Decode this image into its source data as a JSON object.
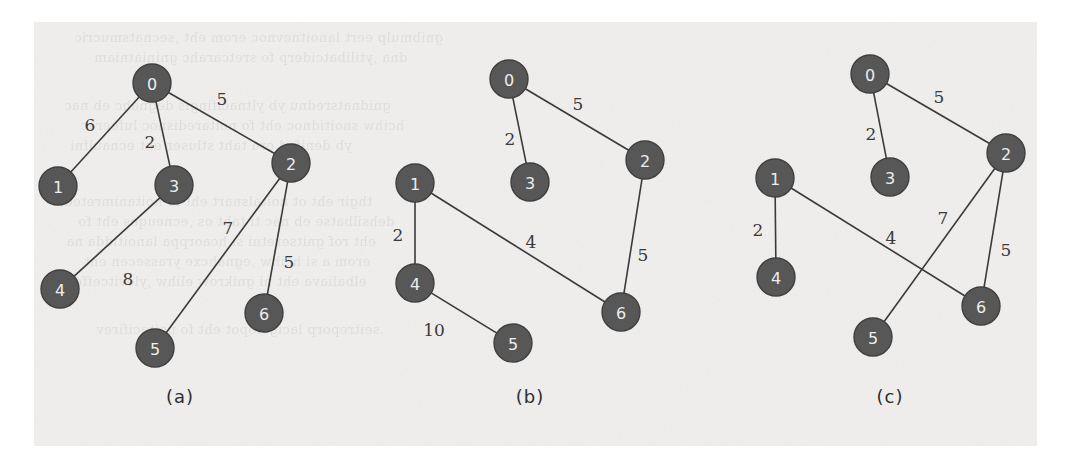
{
  "figure": {
    "background_color": "#f0efee",
    "page_color": "#ffffff",
    "node_fill": "#575757",
    "node_text_color": "#ededed",
    "edge_color": "#3a3a3a"
  },
  "chart_data": {
    "type": "diagram",
    "diagram_kind": "weighted-undirected-graph",
    "title": "",
    "panels": [
      {
        "caption": "(a)",
        "caption_x": 180,
        "caption_y": 396,
        "nodes": [
          {
            "id": "0",
            "x": 152,
            "y": 83,
            "r": 19
          },
          {
            "id": "1",
            "x": 58,
            "y": 186,
            "r": 19
          },
          {
            "id": "3",
            "x": 174,
            "y": 185,
            "r": 19
          },
          {
            "id": "2",
            "x": 291,
            "y": 163,
            "r": 19
          },
          {
            "id": "4",
            "x": 60,
            "y": 289,
            "r": 19
          },
          {
            "id": "5",
            "x": 155,
            "y": 348,
            "r": 19
          },
          {
            "id": "6",
            "x": 264,
            "y": 313,
            "r": 19
          }
        ],
        "edges": [
          {
            "from": "0",
            "to": "1",
            "weight": "6",
            "label_x": 90,
            "label_y": 125
          },
          {
            "from": "0",
            "to": "3",
            "weight": "2",
            "label_x": 150,
            "label_y": 142
          },
          {
            "from": "0",
            "to": "2",
            "weight": "5",
            "label_x": 222,
            "label_y": 99
          },
          {
            "from": "3",
            "to": "4",
            "weight": "8",
            "label_x": 128,
            "label_y": 279
          },
          {
            "from": "2",
            "to": "5",
            "weight": "7",
            "label_x": 228,
            "label_y": 228
          },
          {
            "from": "2",
            "to": "6",
            "weight": "5",
            "label_x": 289,
            "label_y": 262
          }
        ]
      },
      {
        "caption": "(b)",
        "caption_x": 530,
        "caption_y": 396,
        "nodes": [
          {
            "id": "0",
            "x": 509,
            "y": 79,
            "r": 19
          },
          {
            "id": "3",
            "x": 530,
            "y": 182,
            "r": 19
          },
          {
            "id": "2",
            "x": 645,
            "y": 160,
            "r": 19
          },
          {
            "id": "1",
            "x": 415,
            "y": 183,
            "r": 19
          },
          {
            "id": "4",
            "x": 415,
            "y": 283,
            "r": 19
          },
          {
            "id": "5",
            "x": 513,
            "y": 343,
            "r": 19
          },
          {
            "id": "6",
            "x": 621,
            "y": 312,
            "r": 19
          }
        ],
        "edges": [
          {
            "from": "0",
            "to": "3",
            "weight": "2",
            "label_x": 510,
            "label_y": 139
          },
          {
            "from": "0",
            "to": "2",
            "weight": "5",
            "label_x": 578,
            "label_y": 104
          },
          {
            "from": "1",
            "to": "4",
            "weight": "2",
            "label_x": 398,
            "label_y": 235
          },
          {
            "from": "1",
            "to": "6",
            "weight": "4",
            "label_x": 531,
            "label_y": 242
          },
          {
            "from": "4",
            "to": "5",
            "weight": "10",
            "label_x": 434,
            "label_y": 330
          },
          {
            "from": "2",
            "to": "6",
            "weight": "5",
            "label_x": 643,
            "label_y": 255
          }
        ]
      },
      {
        "caption": "(c)",
        "caption_x": 890,
        "caption_y": 396,
        "nodes": [
          {
            "id": "0",
            "x": 870,
            "y": 74,
            "r": 19
          },
          {
            "id": "3",
            "x": 890,
            "y": 177,
            "r": 19
          },
          {
            "id": "2",
            "x": 1006,
            "y": 153,
            "r": 19
          },
          {
            "id": "1",
            "x": 775,
            "y": 178,
            "r": 19
          },
          {
            "id": "4",
            "x": 776,
            "y": 277,
            "r": 19
          },
          {
            "id": "5",
            "x": 873,
            "y": 337,
            "r": 19
          },
          {
            "id": "6",
            "x": 981,
            "y": 306,
            "r": 19
          }
        ],
        "edges": [
          {
            "from": "0",
            "to": "3",
            "weight": "2",
            "label_x": 871,
            "label_y": 134
          },
          {
            "from": "0",
            "to": "2",
            "weight": "5",
            "label_x": 939,
            "label_y": 97
          },
          {
            "from": "1",
            "to": "4",
            "weight": "2",
            "label_x": 758,
            "label_y": 230
          },
          {
            "from": "1",
            "to": "6",
            "weight": "4",
            "label_x": 891,
            "label_y": 238
          },
          {
            "from": "2",
            "to": "5",
            "weight": "7",
            "label_x": 943,
            "label_y": 218
          },
          {
            "from": "2",
            "to": "6",
            "weight": "5",
            "label_x": 1006,
            "label_y": 250
          }
        ]
      }
    ]
  }
}
